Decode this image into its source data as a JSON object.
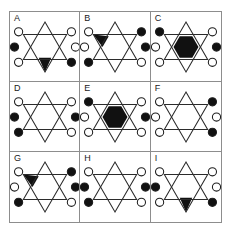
{
  "figure": {
    "type": "3x3-visual-analogy-grid",
    "rows": 3,
    "columns": 3,
    "colors": {
      "filled": "#111111",
      "open": "#ffffff",
      "outline": "#2b2b2b",
      "grid_border": "#8d8d8d",
      "background": "#ffffff"
    },
    "legend": {
      "dot_positions": [
        "upper-left",
        "upper-right",
        "left",
        "right",
        "lower-left",
        "lower-right"
      ],
      "dot_states": [
        "open",
        "filled"
      ],
      "star_fill_options": [
        "none",
        "top-triangle",
        "bottom-triangle",
        "upper-left-triangle",
        "center-hexagon"
      ]
    },
    "cells": [
      {
        "label": "A",
        "star_fill": "bottom-triangle",
        "dots": {
          "upper-left": "open",
          "upper-right": "open",
          "left": "filled",
          "right": "open",
          "lower-left": "open",
          "lower-right": "filled"
        }
      },
      {
        "label": "B",
        "star_fill": "upper-left-triangle",
        "dots": {
          "upper-left": "open",
          "upper-right": "filled",
          "left": "open",
          "right": "filled",
          "lower-left": "filled",
          "lower-right": "open"
        }
      },
      {
        "label": "C",
        "star_fill": "center-hexagon",
        "dots": {
          "upper-left": "filled",
          "upper-right": "open",
          "left": "open",
          "right": "filled",
          "lower-left": "open",
          "lower-right": "open"
        }
      },
      {
        "label": "D",
        "star_fill": "none",
        "dots": {
          "upper-left": "open",
          "upper-right": "open",
          "left": "filled",
          "right": "filled",
          "lower-left": "filled",
          "lower-right": "open"
        }
      },
      {
        "label": "E",
        "star_fill": "center-hexagon",
        "dots": {
          "upper-left": "filled",
          "upper-right": "open",
          "left": "open",
          "right": "filled",
          "lower-left": "open",
          "lower-right": "open"
        }
      },
      {
        "label": "F",
        "star_fill": "none",
        "dots": {
          "upper-left": "open",
          "upper-right": "filled",
          "left": "open",
          "right": "open",
          "lower-left": "open",
          "lower-right": "filled"
        }
      },
      {
        "label": "G",
        "star_fill": "upper-left-triangle",
        "dots": {
          "upper-left": "open",
          "upper-right": "filled",
          "left": "open",
          "right": "filled",
          "lower-left": "filled",
          "lower-right": "open"
        }
      },
      {
        "label": "H",
        "star_fill": "none",
        "dots": {
          "upper-left": "open",
          "upper-right": "open",
          "left": "filled",
          "right": "filled",
          "lower-left": "filled",
          "lower-right": "open"
        }
      },
      {
        "label": "I",
        "star_fill": "bottom-triangle",
        "dots": {
          "upper-left": "open",
          "upper-right": "open",
          "left": "filled",
          "right": "open",
          "lower-left": "open",
          "lower-right": "filled"
        }
      }
    ]
  }
}
